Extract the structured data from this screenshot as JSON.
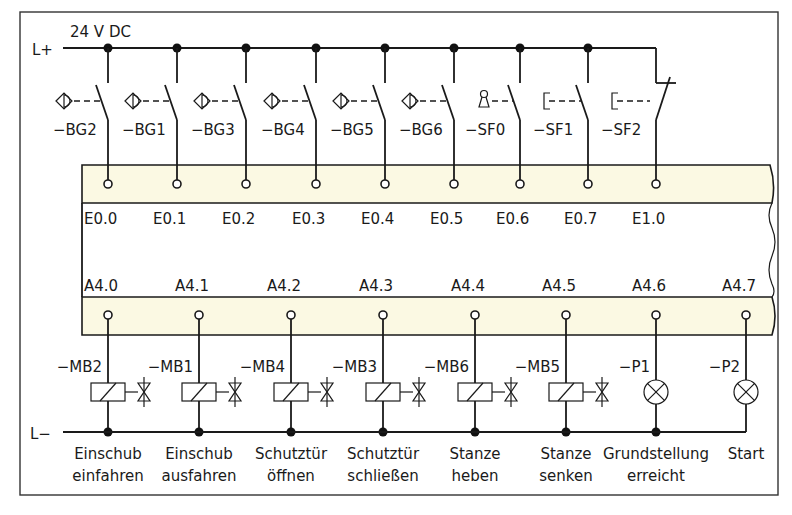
{
  "rails": {
    "positive_label": "L+",
    "positive_voltage": "24 V DC",
    "negative_label": "L−"
  },
  "inputs": [
    {
      "device": "−BG2",
      "symbol": "proximity-sensor",
      "contact": "NO",
      "address": "E0.0"
    },
    {
      "device": "−BG1",
      "symbol": "proximity-sensor",
      "contact": "NO",
      "address": "E0.1"
    },
    {
      "device": "−BG3",
      "symbol": "proximity-sensor",
      "contact": "NO",
      "address": "E0.2"
    },
    {
      "device": "−BG4",
      "symbol": "proximity-sensor",
      "contact": "NO",
      "address": "E0.3"
    },
    {
      "device": "−BG5",
      "symbol": "proximity-sensor",
      "contact": "NO",
      "address": "E0.4"
    },
    {
      "device": "−BG6",
      "symbol": "proximity-sensor",
      "contact": "NO",
      "address": "E0.5"
    },
    {
      "device": "−SF0",
      "symbol": "key-switch",
      "contact": "NO",
      "address": "E0.6"
    },
    {
      "device": "−SF1",
      "symbol": "push-button",
      "contact": "NO",
      "address": "E0.7"
    },
    {
      "device": "−SF2",
      "symbol": "push-button",
      "contact": "NC",
      "address": "E1.0"
    }
  ],
  "outputs": [
    {
      "device": "−MB2",
      "symbol": "solenoid-valve",
      "address": "A4.0",
      "desc1": "Einschub",
      "desc2": "einfahren"
    },
    {
      "device": "−MB1",
      "symbol": "solenoid-valve",
      "address": "A4.1",
      "desc1": "Einschub",
      "desc2": "ausfahren"
    },
    {
      "device": "−MB4",
      "symbol": "solenoid-valve",
      "address": "A4.2",
      "desc1": "Schutztür",
      "desc2": "öffnen"
    },
    {
      "device": "−MB3",
      "symbol": "solenoid-valve",
      "address": "A4.3",
      "desc1": "Schutztür",
      "desc2": "schließen"
    },
    {
      "device": "−MB6",
      "symbol": "solenoid-valve",
      "address": "A4.4",
      "desc1": "Stanze",
      "desc2": "heben"
    },
    {
      "device": "−MB5",
      "symbol": "solenoid-valve",
      "address": "A4.5",
      "desc1": "Stanze",
      "desc2": "senken"
    },
    {
      "device": "−P1",
      "symbol": "indicator-lamp",
      "address": "A4.6",
      "desc1": "Grundstellung",
      "desc2": "erreicht"
    },
    {
      "device": "−P2",
      "symbol": "indicator-lamp",
      "address": "A4.7",
      "desc1": "Start",
      "desc2": ""
    }
  ],
  "colors": {
    "plc_band": "#fbf9e3",
    "line": "#1a1a1a"
  }
}
